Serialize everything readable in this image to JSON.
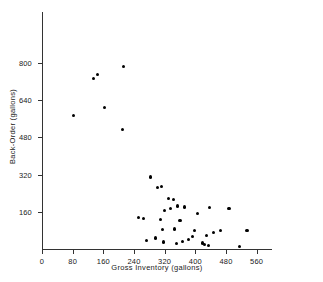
{
  "chart_data": {
    "type": "scatter",
    "title": "",
    "xlabel": "Gross Inventory (gallons)",
    "ylabel": "Back-Order (gallons)",
    "xlim": [
      0,
      600
    ],
    "ylim": [
      0,
      1020
    ],
    "grid": false,
    "legend": null,
    "xticks": [
      0,
      80,
      160,
      240,
      320,
      400,
      480,
      560
    ],
    "xticklabels": [
      "0",
      "80",
      "160",
      "240",
      "320",
      "400",
      "480",
      "560"
    ],
    "yticks": [
      160,
      320,
      480,
      640,
      800
    ],
    "yticklabels": [
      "160",
      "320",
      "480",
      "640",
      "800"
    ],
    "marker": "filled-circle",
    "marker_color": "#000000",
    "points": [
      {
        "x": 82,
        "y": 574
      },
      {
        "x": 145,
        "y": 752
      },
      {
        "x": 134,
        "y": 735
      },
      {
        "x": 163,
        "y": 610
      },
      {
        "x": 213,
        "y": 787
      },
      {
        "x": 211,
        "y": 516
      },
      {
        "x": 252,
        "y": 134
      },
      {
        "x": 265,
        "y": 132
      },
      {
        "x": 272,
        "y": 36
      },
      {
        "x": 284,
        "y": 310
      },
      {
        "x": 296,
        "y": 47
      },
      {
        "x": 301,
        "y": 264
      },
      {
        "x": 310,
        "y": 127
      },
      {
        "x": 312,
        "y": 269
      },
      {
        "x": 314,
        "y": 85
      },
      {
        "x": 318,
        "y": 30
      },
      {
        "x": 320,
        "y": 167
      },
      {
        "x": 329,
        "y": 217
      },
      {
        "x": 336,
        "y": 175
      },
      {
        "x": 342,
        "y": 212
      },
      {
        "x": 345,
        "y": 86
      },
      {
        "x": 350,
        "y": 23
      },
      {
        "x": 353,
        "y": 185
      },
      {
        "x": 360,
        "y": 122
      },
      {
        "x": 366,
        "y": 33
      },
      {
        "x": 372,
        "y": 181
      },
      {
        "x": 382,
        "y": 42
      },
      {
        "x": 393,
        "y": 55
      },
      {
        "x": 398,
        "y": 80
      },
      {
        "x": 406,
        "y": 152
      },
      {
        "x": 418,
        "y": 26
      },
      {
        "x": 424,
        "y": 19
      },
      {
        "x": 429,
        "y": 58
      },
      {
        "x": 434,
        "y": 16
      },
      {
        "x": 437,
        "y": 179
      },
      {
        "x": 447,
        "y": 71
      },
      {
        "x": 466,
        "y": 80
      },
      {
        "x": 488,
        "y": 176
      },
      {
        "x": 516,
        "y": 12
      },
      {
        "x": 535,
        "y": 80
      }
    ]
  }
}
